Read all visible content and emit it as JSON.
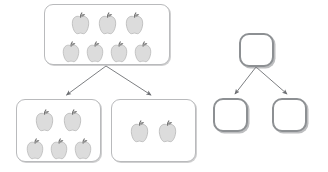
{
  "diagram": {
    "background_color": "#ffffff",
    "box_border_color": "#b9babc",
    "empty_box_border_color": "#8d9093",
    "arrow_color": "#6e7074",
    "apple_body_color": "#dcdcdc",
    "apple_outline_color": "#b0b0b0",
    "apple_stem_color": "#6f6f6f",
    "apple_leaf_color": "#8e8e8e",
    "icon_names": {
      "apple": "apple-icon",
      "arrow": "arrow-down-icon"
    }
  },
  "concrete_tree": {
    "name": "apple-part-whole-tree",
    "whole": {
      "label": "whole-group-of-apples",
      "apple_count": 7,
      "rows": [
        3,
        4
      ]
    },
    "parts": [
      {
        "label": "left-part-group",
        "apple_count": 5,
        "rows": [
          2,
          3
        ]
      },
      {
        "label": "right-part-group",
        "apple_count": 2,
        "rows": [
          2
        ]
      }
    ],
    "arrows": [
      {
        "label": "arrow-whole-to-left-part",
        "from": "whole",
        "to": "left-part-group"
      },
      {
        "label": "arrow-whole-to-right-part",
        "from": "whole",
        "to": "right-part-group"
      }
    ]
  },
  "abstract_tree": {
    "name": "empty-part-whole-template",
    "whole": {
      "label": "empty-whole-box",
      "content": ""
    },
    "parts": [
      {
        "label": "empty-left-part-box",
        "content": ""
      },
      {
        "label": "empty-right-part-box",
        "content": ""
      }
    ],
    "arrows": [
      {
        "label": "arrow-empty-whole-to-left",
        "from": "empty-whole-box",
        "to": "empty-left-part-box"
      },
      {
        "label": "arrow-empty-whole-to-right",
        "from": "empty-whole-box",
        "to": "empty-right-part-box"
      }
    ]
  }
}
